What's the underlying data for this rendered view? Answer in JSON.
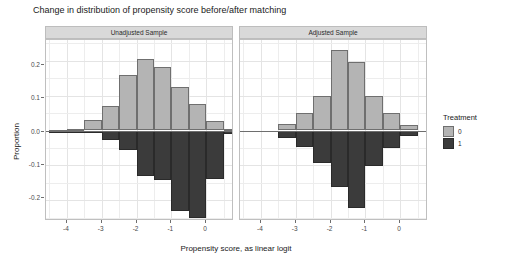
{
  "chart_data": {
    "type": "bar",
    "title": "Change in distribution of propensity score before/after matching",
    "xlabel": "Propensity score, as linear logit",
    "ylabel": "Proportion",
    "xlim": [
      -4.6,
      0.8
    ],
    "ylim": [
      -0.26,
      0.26
    ],
    "grid": true,
    "legend": {
      "title": "Treatment",
      "position": "right",
      "entries": [
        "0",
        "1"
      ]
    },
    "colors": {
      "treatment_0": "#b4b4b4",
      "treatment_1": "#3b3b3b",
      "strip": "#d9d9d9",
      "panel_border": "#bfbfbf"
    },
    "y_ticks": [
      0.2,
      0.1,
      0.0,
      -0.1,
      -0.2
    ],
    "y_tick_labels": [
      "0.2",
      "0.1",
      "0.0",
      "-0.1",
      "-0.2"
    ],
    "x_ticks": [
      -4,
      -3,
      -2,
      -1,
      0
    ],
    "x_tick_labels": [
      "-4",
      "-3",
      "-2",
      "-1",
      "0"
    ],
    "bin_width": 0.5,
    "panels": [
      {
        "label": "Unadjusted Sample",
        "bins": [
          -4.25,
          -3.75,
          -3.25,
          -2.75,
          -2.25,
          -1.75,
          -1.25,
          -0.75,
          -0.25,
          0.25,
          0.75
        ],
        "series": [
          {
            "name": "0",
            "values": [
              0.002,
              0.004,
              0.03,
              0.069,
              0.16,
              0.205,
              0.183,
              0.125,
              0.077,
              0.026,
              0.004
            ]
          },
          {
            "name": "1",
            "values": [
              -0.001,
              -0.002,
              -0.006,
              -0.028,
              -0.057,
              -0.13,
              -0.142,
              -0.232,
              -0.252,
              -0.14,
              -0.009
            ]
          }
        ]
      },
      {
        "label": "Adjusted Sample",
        "bins": [
          -3.25,
          -2.75,
          -2.25,
          -1.75,
          -1.25,
          -0.75,
          -0.25,
          0.25
        ],
        "series": [
          {
            "name": "0",
            "values": [
              0.018,
              0.05,
              0.1,
              0.232,
              0.196,
              0.1,
              0.05,
              0.015
            ]
          },
          {
            "name": "1",
            "values": [
              -0.021,
              -0.046,
              -0.093,
              -0.162,
              -0.224,
              -0.101,
              -0.05,
              -0.017
            ]
          }
        ]
      }
    ]
  }
}
